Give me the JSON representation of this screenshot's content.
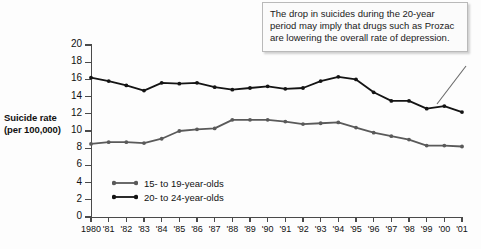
{
  "chart_data": {
    "type": "line",
    "title": "",
    "xlabel": "",
    "ylabel": "Suicide rate (per 100,000)",
    "ylim": [
      0,
      20
    ],
    "ytick_step": 2,
    "grid": false,
    "legend_position": "inside-bottom-left",
    "categories": [
      "1980",
      "'81",
      "'82",
      "'83",
      "'84",
      "'85",
      "'86",
      "'87",
      "'88",
      "'89",
      "'90",
      "'91",
      "'92",
      "'93",
      "'94",
      "'95",
      "'96",
      "'97",
      "'98",
      "'99",
      "'00",
      "'01"
    ],
    "yticks": [
      "0",
      "2",
      "4",
      "6",
      "8",
      "10",
      "12",
      "14",
      "16",
      "18",
      "20"
    ],
    "series": [
      {
        "name": "15- to 19-year-olds",
        "color": "#5a5a5a",
        "values": [
          8.5,
          8.7,
          8.7,
          8.6,
          9.1,
          10.0,
          10.2,
          10.3,
          11.3,
          11.3,
          11.3,
          11.1,
          10.8,
          10.9,
          11.0,
          10.4,
          9.8,
          9.4,
          9.0,
          8.3,
          8.3,
          8.2
        ]
      },
      {
        "name": "20- to 24-year-olds",
        "color": "#141414",
        "values": [
          16.2,
          15.8,
          15.3,
          14.7,
          15.6,
          15.5,
          15.6,
          15.1,
          14.8,
          15.0,
          15.2,
          14.9,
          15.0,
          15.8,
          16.3,
          16.0,
          14.5,
          13.5,
          13.5,
          12.6,
          12.9,
          12.2
        ]
      }
    ],
    "annotation": {
      "text": "The drop in suicides during the 20-year period may imply that drugs such as Prozac are lowering the overall rate of depression.",
      "points_to": "'01"
    }
  },
  "y_axis": {
    "title_line1": "Suicide rate",
    "title_line2": "(per 100,000)"
  },
  "legend": {
    "items": [
      {
        "label": "15- to 19-year-olds",
        "color": "#5a5a5a"
      },
      {
        "label": "20- to 24-year-olds",
        "color": "#141414"
      }
    ]
  },
  "callout": {
    "text": "The drop in suicides during the 20-year period may imply that drugs such as Prozac are lowering the overall rate of depression."
  },
  "colors": {
    "axis": "#4a4a4a",
    "text": "#111111",
    "series_young": "#5a5a5a",
    "series_old": "#141414",
    "callout_bg": "#fbfbfb",
    "callout_border": "#b9b9b9",
    "page_bg": "#fdfdfd"
  }
}
